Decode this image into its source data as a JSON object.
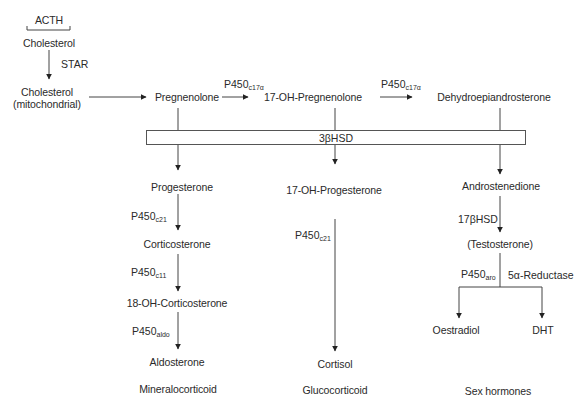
{
  "regulator": {
    "label": "ACTH"
  },
  "chain_top": {
    "cholesterol": "Cholesterol",
    "transport_enzyme": "STAR",
    "cholesterol_mito_line1": "Cholesterol",
    "cholesterol_mito_line2": "(mitochondrial)"
  },
  "main_row": {
    "pregnenolone": "Pregnenolone",
    "oh_pregnenolone": "17-OH-Pregnenolone",
    "dhea": "Dehydroepiandrosterone",
    "enzyme_1": {
      "base": "P450",
      "sub": "c17α"
    },
    "enzyme_2": {
      "base": "P450",
      "sub": "c17α"
    }
  },
  "hsd_box": {
    "label": "3βHSD"
  },
  "mineralocorticoid": {
    "progesterone": "Progesterone",
    "enzyme_c21": {
      "base": "P450",
      "sub": "c21"
    },
    "corticosterone": "Corticosterone",
    "enzyme_c11": {
      "base": "P450",
      "sub": "c11"
    },
    "oh_corticosterone": "18-OH-Corticosterone",
    "enzyme_aldo": {
      "base": "P450",
      "sub": "aldo"
    },
    "aldosterone": "Aldosterone",
    "class_label": "Mineralocorticoid"
  },
  "glucocorticoid": {
    "oh_progesterone": "17-OH-Progesterone",
    "enzyme_c21": {
      "base": "P450",
      "sub": "c21"
    },
    "cortisol": "Cortisol",
    "class_label": "Glucocorticoid"
  },
  "sex_hormones": {
    "androstenedione": "Androstenedione",
    "enzyme_17bhsd": "17βHSD",
    "testosterone": "(Testosterone)",
    "enzyme_aro": {
      "base": "P450",
      "sub": "aro"
    },
    "enzyme_reductase": "5α-Reductase",
    "oestradiol": "Oestradiol",
    "dht": "DHT",
    "class_label": "Sex hormones"
  }
}
